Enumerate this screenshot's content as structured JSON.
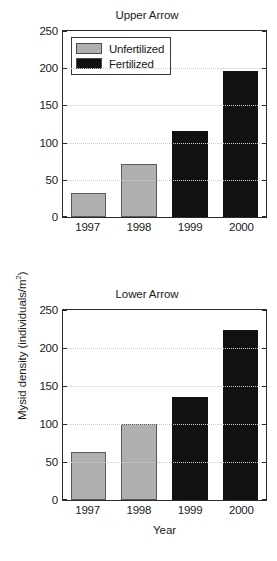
{
  "figure": {
    "ylabel_text": "Mysid density (individuals/m",
    "ylabel_sup": "2",
    "ylabel_close": ")",
    "xlabel": "Year",
    "colors": {
      "unfertilized": "#b0b0b0",
      "fertilized": "#111111",
      "axis": "#2b2b2b",
      "grid": "#c9c9c9",
      "background": "#ffffff"
    }
  },
  "legend": {
    "items": [
      {
        "label": "Unfertilized",
        "color": "#b0b0b0"
      },
      {
        "label": "Fertilized",
        "color": "#111111"
      }
    ]
  },
  "chart_data": [
    {
      "type": "bar",
      "title": "Upper Arrow",
      "xlabel": "Year",
      "ylabel": "Mysid density (individuals/m2)",
      "categories": [
        "1997",
        "1998",
        "1999",
        "2000"
      ],
      "values": [
        32,
        71,
        116,
        196
      ],
      "series": [
        {
          "name": "Unfertilized",
          "categories": [
            "1997",
            "1998"
          ],
          "values": [
            32,
            71
          ]
        },
        {
          "name": "Fertilized",
          "categories": [
            "1999",
            "2000"
          ],
          "values": [
            116,
            196
          ]
        }
      ],
      "treatment": [
        "Unfertilized",
        "Unfertilized",
        "Fertilized",
        "Fertilized"
      ],
      "ylim": [
        0,
        250
      ],
      "yticks": [
        0,
        50,
        100,
        150,
        200,
        250
      ],
      "grid": true,
      "legend_position": "top-left"
    },
    {
      "type": "bar",
      "title": "Lower Arrow",
      "xlabel": "Year",
      "ylabel": "Mysid density (individuals/m2)",
      "categories": [
        "1997",
        "1998",
        "1999",
        "2000"
      ],
      "values": [
        63,
        100,
        135,
        224
      ],
      "series": [
        {
          "name": "Unfertilized",
          "categories": [
            "1997",
            "1998"
          ],
          "values": [
            63,
            100
          ]
        },
        {
          "name": "Fertilized",
          "categories": [
            "1999",
            "2000"
          ],
          "values": [
            135,
            224
          ]
        }
      ],
      "treatment": [
        "Unfertilized",
        "Unfertilized",
        "Fertilized",
        "Fertilized"
      ],
      "ylim": [
        0,
        250
      ],
      "yticks": [
        0,
        50,
        100,
        150,
        200,
        250
      ],
      "grid": true,
      "legend_position": "none"
    }
  ]
}
